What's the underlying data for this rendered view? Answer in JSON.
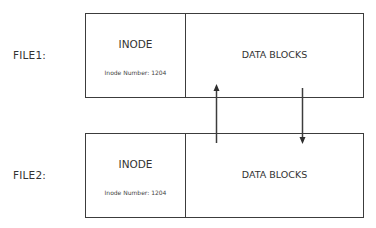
{
  "diagram": {
    "type": "hard-link-inode-diagram",
    "files": [
      {
        "label": "FILE1:",
        "inode_title": "INODE",
        "inode_number_text": "Inode Number: 1204",
        "data_title": "DATA BLOCKS"
      },
      {
        "label": "FILE2:",
        "inode_title": "INODE",
        "inode_number_text": "Inode Number: 1204",
        "data_title": "DATA BLOCKS"
      }
    ],
    "arrows": [
      {
        "direction": "up",
        "from": "FILE2 data blocks",
        "to": "FILE1 data blocks"
      },
      {
        "direction": "down",
        "from": "FILE1 data blocks",
        "to": "FILE2 data blocks"
      }
    ],
    "colors": {
      "line": "#3c3c3c",
      "text": "#333333",
      "background": "#ffffff"
    }
  }
}
